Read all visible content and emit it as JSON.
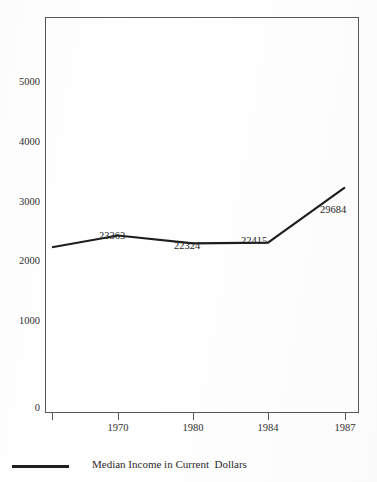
{
  "chart_data": {
    "type": "line",
    "title": "",
    "clipped_top_text": "",
    "xlabel": "",
    "ylabel": "",
    "categories": [
      "",
      "1970",
      "1980",
      "1984",
      "1987"
    ],
    "x_tick_labels": [
      "",
      "1970",
      "1980",
      "1984",
      "1987"
    ],
    "y_tick_labels": [
      "0",
      "1000",
      "2000",
      "3000",
      "4000",
      "5000"
    ],
    "y_tick_values": [
      0,
      1000,
      2000,
      3000,
      4000,
      5000
    ],
    "ylim": [
      0,
      5900
    ],
    "grid": false,
    "legend_position": "bottom-left",
    "series": [
      {
        "name": "Median Income in Current  Dollars",
        "point_labels": [
          "",
          "23363",
          "22324",
          "22415",
          "29684"
        ],
        "values": [
          2180,
          2336,
          2232,
          2242,
          2968
        ],
        "actual_values": [
          21800,
          23363,
          22324,
          22415,
          29684
        ],
        "color": "#1e1e1e"
      }
    ],
    "annotations": [
      {
        "text": "23363",
        "at_category": "1970"
      },
      {
        "text": "22324",
        "at_category": "1980"
      },
      {
        "text": "22415",
        "at_category": "1984"
      },
      {
        "text": "29684",
        "at_category": "1987"
      }
    ]
  },
  "axis": {
    "y_labels": [
      {
        "text": "5000",
        "top": 77
      },
      {
        "text": "4000",
        "top": 137
      },
      {
        "text": "3000",
        "top": 197
      },
      {
        "text": "2000",
        "top": 256
      },
      {
        "text": "1000",
        "top": 316
      },
      {
        "text": "0",
        "top": 403
      }
    ],
    "x_labels": [
      {
        "text": "1970",
        "left": 118
      },
      {
        "text": "1980",
        "left": 193
      },
      {
        "text": "1984",
        "left": 268
      },
      {
        "text": "1987",
        "left": 345
      }
    ]
  },
  "point_labels": [
    {
      "text": "23363",
      "left": 99,
      "top": 231
    },
    {
      "text": "22324",
      "left": 174,
      "top": 241
    },
    {
      "text": "22415",
      "left": 241,
      "top": 236
    },
    {
      "text": "29684",
      "left": 320,
      "top": 205
    }
  ],
  "legend": {
    "label": "Median Income in Current  Dollars",
    "swatch_color": "#1e1e1e"
  },
  "colors": {
    "line": "#1e1e1e",
    "frame": "#585858",
    "text": "#2b2b2b",
    "background": "#ffffff"
  }
}
